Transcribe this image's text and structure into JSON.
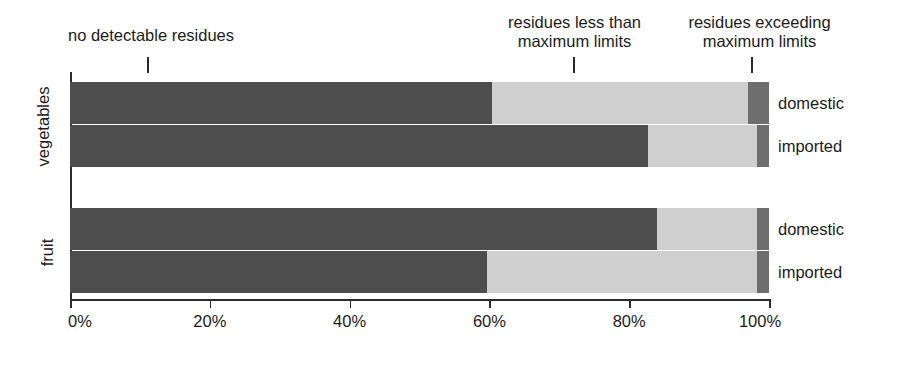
{
  "chart_data": {
    "type": "bar",
    "orientation": "horizontal",
    "stacked": true,
    "title": "",
    "xlabel": "",
    "ylabel": "",
    "xlim": [
      0,
      100
    ],
    "grid": false,
    "legend_position": "callout-annotations-above-plot",
    "x_ticks": [
      "0%",
      "20%",
      "40%",
      "60%",
      "80%",
      "100%"
    ],
    "x_tick_values": [
      0,
      20,
      40,
      60,
      80,
      100
    ],
    "series": [
      {
        "name": "no detectable residues",
        "color": "#4d4d4d",
        "values": [
          60.4,
          82.7,
          84.0,
          59.7
        ]
      },
      {
        "name": "residues less than maximum limits",
        "color": "#cfcfcf",
        "values": [
          36.6,
          15.6,
          14.3,
          38.6
        ]
      },
      {
        "name": "residues exceeding maximum limits",
        "color": "#6e6e6e",
        "values": [
          3.0,
          1.7,
          1.7,
          1.7
        ]
      }
    ],
    "groups": [
      {
        "label": "vegetables",
        "bars": [
          {
            "label": "domestic",
            "segments": [
              60.4,
              36.6,
              3.0
            ]
          },
          {
            "label": "imported",
            "segments": [
              82.7,
              15.6,
              1.7
            ]
          }
        ]
      },
      {
        "label": "fruit",
        "bars": [
          {
            "label": "domestic",
            "segments": [
              84.0,
              14.3,
              1.7
            ]
          },
          {
            "label": "imported",
            "segments": [
              59.7,
              38.6,
              1.7
            ]
          }
        ]
      }
    ],
    "annotations": [
      {
        "text": "no detectable residues",
        "pointer_value": 11
      },
      {
        "text": "residues less than\nmaximum limits",
        "pointer_value": 72
      },
      {
        "text": "residues exceeding\nmaximum limits",
        "pointer_value": 97.5
      }
    ]
  },
  "axis": {
    "tick_0": "0%",
    "tick_1": "20%",
    "tick_2": "40%",
    "tick_3": "60%",
    "tick_4": "80%",
    "tick_5": "100%"
  },
  "annotations": {
    "left": "no detectable residues",
    "middle": "residues less than\nmaximum limits",
    "right": "residues exceeding\nmaximum limits"
  },
  "categories": {
    "group_1": "vegetables",
    "group_2": "fruit"
  },
  "bar_labels": {
    "g1_b1": "domestic",
    "g1_b2": "imported",
    "g2_b1": "domestic",
    "g2_b2": "imported"
  },
  "colors": {
    "none_detected": "#4d4d4d",
    "under_limit": "#cfcfcf",
    "over_limit": "#6e6e6e",
    "axis": "#2b2b2b",
    "text": "#1c1c1c",
    "background": "#ffffff"
  }
}
